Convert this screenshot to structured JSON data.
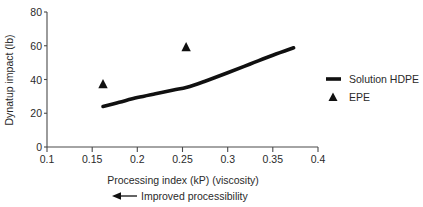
{
  "chart_data": {
    "type": "line",
    "title": "",
    "xlabel": "Processing index (kP) (viscosity)",
    "ylabel": "Dynatup impact (lb)",
    "xlim": [
      0.1,
      0.4
    ],
    "ylim": [
      0,
      80
    ],
    "grid": false,
    "legend_position": "right",
    "x_ticks": [
      0.1,
      0.15,
      0.2,
      0.25,
      0.3,
      0.35,
      0.4
    ],
    "x_tick_labels": [
      "0.1",
      "0.15",
      "0.2",
      "0.25",
      "0.3",
      "0.35",
      "0.4"
    ],
    "y_ticks": [
      0,
      20,
      40,
      60,
      80
    ],
    "y_tick_labels": [
      "0",
      "20",
      "40",
      "60",
      "80"
    ],
    "annotation": "Improved processibility",
    "annotation_arrow": "left-arrow",
    "series": [
      {
        "name": "Solution HDPE",
        "type": "line",
        "marker": "none",
        "color": "#101010",
        "points": [
          {
            "x": 0.162,
            "y": 24.0
          },
          {
            "x": 0.18,
            "y": 26.5
          },
          {
            "x": 0.2,
            "y": 29.3
          },
          {
            "x": 0.22,
            "y": 31.6
          },
          {
            "x": 0.24,
            "y": 33.8
          },
          {
            "x": 0.255,
            "y": 35.4
          },
          {
            "x": 0.275,
            "y": 39.0
          },
          {
            "x": 0.3,
            "y": 44.0
          },
          {
            "x": 0.325,
            "y": 49.2
          },
          {
            "x": 0.35,
            "y": 54.4
          },
          {
            "x": 0.373,
            "y": 58.8
          }
        ]
      },
      {
        "name": "EPE",
        "type": "scatter",
        "marker": "triangle",
        "color": "#101010",
        "points": [
          {
            "x": 0.162,
            "y": 37.5
          },
          {
            "x": 0.254,
            "y": 59.5
          }
        ]
      }
    ],
    "legend_entries": [
      {
        "label": "Solution HDPE",
        "marker": "line"
      },
      {
        "label": "EPE",
        "marker": "triangle"
      }
    ]
  }
}
